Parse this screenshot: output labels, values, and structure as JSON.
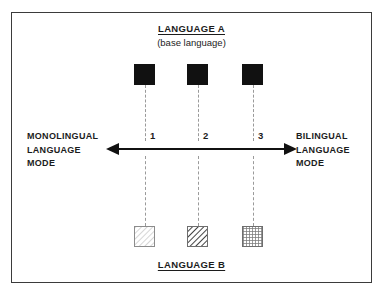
{
  "figure": {
    "title_top": "LANGUAGE A",
    "subtitle_top": "(base language)",
    "title_bottom": "LANGUAGE B",
    "left_axis_label": "MONOLINGUAL\nLANGUAGE\nMODE",
    "right_axis_label": "BILINGUAL\nLANGUAGE\nMODE",
    "colors": {
      "frame": "#3b3b3b",
      "axis": "#111111",
      "dashed": "#9a9a9a",
      "language_a_fill": "#111111",
      "text": "#1c1c1c"
    },
    "positions": [
      {
        "number": "1",
        "x": 145
      },
      {
        "number": "2",
        "x": 198
      },
      {
        "number": "3",
        "x": 253
      }
    ],
    "language_a_nodes": [
      {
        "label": "language-a-square-1",
        "fill": "solid-black"
      },
      {
        "label": "language-a-square-2",
        "fill": "solid-black"
      },
      {
        "label": "language-a-square-3",
        "fill": "solid-black"
      }
    ],
    "language_b_nodes": [
      {
        "label": "language-b-square-1",
        "fill": "light-diagonal-hatch"
      },
      {
        "label": "language-b-square-2",
        "fill": "bold-diagonal-hatch"
      },
      {
        "label": "language-b-square-3",
        "fill": "dense-cross-hatch"
      }
    ]
  }
}
